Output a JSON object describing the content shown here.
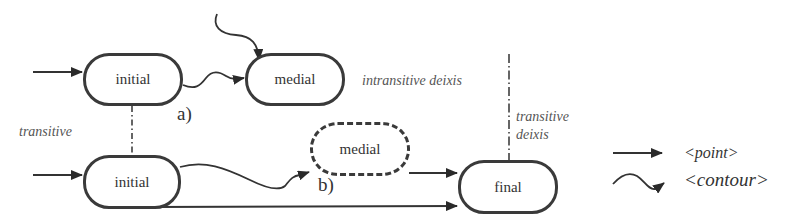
{
  "diagram": {
    "nodes": {
      "initial_top": "initial",
      "medial_top": "medial",
      "initial_bottom": "initial",
      "medial_dashed": "medial",
      "final": "final"
    },
    "labels": {
      "a": "a)",
      "b": "b)",
      "transitive": "transitive",
      "intransitive_deixis": "intransitive deixis",
      "transitive_deixis_line1": "transitive",
      "transitive_deixis_line2": "deixis"
    },
    "legend": {
      "point": "<point>",
      "contour": "<contour>"
    },
    "colors": {
      "stroke": "#3a3a3a",
      "label": "#555555"
    }
  }
}
